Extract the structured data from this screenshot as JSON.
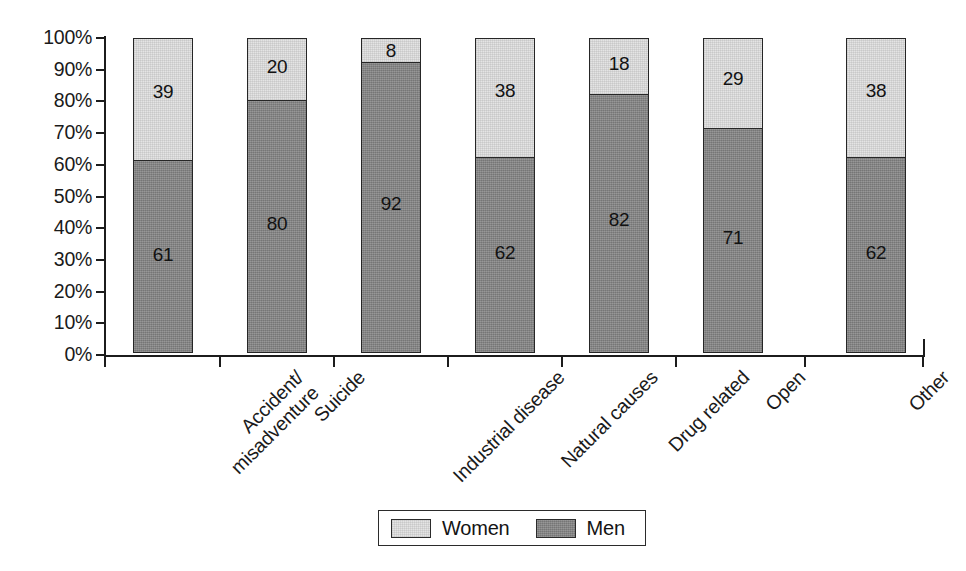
{
  "chart_data": {
    "type": "bar",
    "subtype": "stacked-100-percent",
    "title": "",
    "subtitle": "",
    "xlabel": "",
    "ylabel": "",
    "ylim": [
      0,
      100
    ],
    "grid": false,
    "legend_position": "bottom",
    "categories": [
      "Accident/ misadventure",
      "Suicide",
      "Industrial disease",
      "Natural causes",
      "Drug related",
      "Open",
      "Other"
    ],
    "category_lines": [
      [
        "Accident/",
        "misadventure"
      ],
      [
        "Suicide",
        ""
      ],
      [
        "Industrial disease",
        ""
      ],
      [
        "Natural causes",
        ""
      ],
      [
        "Drug related",
        ""
      ],
      [
        "Open",
        ""
      ],
      [
        "Other",
        ""
      ]
    ],
    "series": [
      {
        "name": "Men",
        "color": "#818181",
        "values": [
          61,
          80,
          92,
          62,
          82,
          71,
          62
        ]
      },
      {
        "name": "Women",
        "color": "#e4e4e4",
        "values": [
          39,
          20,
          8,
          38,
          18,
          29,
          38
        ]
      }
    ],
    "y_tick_labels": [
      "100%",
      "90%",
      "80%",
      "70%",
      "60%",
      "50%",
      "40%",
      "30%",
      "20%",
      "10%",
      "0%"
    ],
    "y_tick_values": [
      100,
      90,
      80,
      70,
      60,
      50,
      40,
      30,
      20,
      10,
      0
    ]
  },
  "legend": {
    "items": [
      {
        "label": "Women",
        "swatch": "women"
      },
      {
        "label": "Men",
        "swatch": "men"
      }
    ]
  }
}
